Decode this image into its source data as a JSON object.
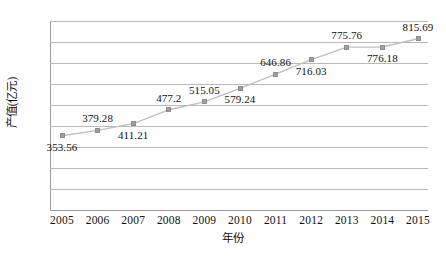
{
  "chart_data": {
    "type": "line",
    "title": "",
    "subtitle": "",
    "xlabel": "年份",
    "ylabel": "产值(亿元)",
    "categories": [
      "2005",
      "2006",
      "2007",
      "2008",
      "2009",
      "2010",
      "2011",
      "2012",
      "2013",
      "2014",
      "2015"
    ],
    "values": [
      353.56,
      379.28,
      411.21,
      477.2,
      515.05,
      579.24,
      646.86,
      716.03,
      775.76,
      776.18,
      815.69
    ],
    "point_labels": [
      "353.56",
      "379.28",
      "411.21",
      "477.2",
      "515.05",
      "579.24",
      "646.86",
      "716.03",
      "775.76",
      "776.18",
      "815.69"
    ],
    "label_positions": [
      "below",
      "above",
      "below",
      "above",
      "above",
      "below",
      "above",
      "below",
      "above",
      "below",
      "above"
    ],
    "ylim": [
      0,
      900
    ],
    "ytick_values": [
      900,
      800,
      700,
      600,
      500,
      400,
      300,
      200,
      100,
      0
    ],
    "ytick_labels": [
      "900",
      "800",
      "700",
      "600",
      "500",
      "400",
      "300",
      "200",
      "100",
      "0"
    ],
    "grid": true,
    "legend": "none",
    "series": [
      {
        "name": "产值(亿元)",
        "values": [
          353.56,
          379.28,
          411.21,
          477.2,
          515.05,
          579.24,
          646.86,
          716.03,
          775.76,
          776.18,
          815.69
        ]
      }
    ],
    "colors": {
      "line": "#bfbfbf",
      "marker": "#a0a0a0",
      "marker_border": "#8d8d8d",
      "gridline": "#b9b9b9",
      "axis": "#9a9a9a",
      "text": "#111111",
      "background": "#ffffff"
    }
  }
}
